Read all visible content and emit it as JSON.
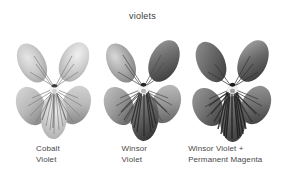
{
  "page": {
    "title": "violets",
    "background_color": "#ffffff",
    "text_color": "#4a4a4a",
    "width": 285,
    "height": 179
  },
  "swatches": [
    {
      "id": "cobalt-violet",
      "subject": "violet-flower",
      "label_line_1": "Cobalt",
      "label_line_2": "Violet",
      "tone": "light",
      "petal_fill": "#c9c9c9",
      "vein_color": "#6a6a6a",
      "shadow_color": "#9a9a9a"
    },
    {
      "id": "winsor-violet",
      "subject": "violet-flower",
      "label_line_1": "Winsor",
      "label_line_2": "Violet",
      "tone": "medium",
      "petal_fill": "#a8a8a8",
      "vein_color": "#3d3d3d",
      "shadow_color": "#666666"
    },
    {
      "id": "winsor-violet-permanent-magenta",
      "subject": "violet-flower",
      "label_line_1": "Winsor Violet +",
      "label_line_2": "Permanent Magenta",
      "tone": "dark",
      "petal_fill": "#8f8f8f",
      "vein_color": "#2a2a2a",
      "shadow_color": "#4e4e4e"
    }
  ]
}
